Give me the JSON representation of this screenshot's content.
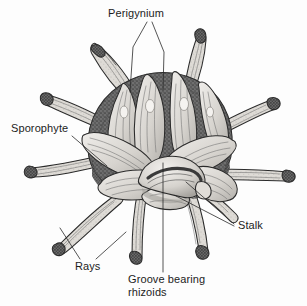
{
  "figure": {
    "kind": "botanical-illustration",
    "style": "grayscale stipple and line engraving",
    "background_color": "#fdfdfd",
    "ink_color": "#2b2b2b",
    "label_color": "#1c1c1c",
    "palette": {
      "paper": "#fdfdfd",
      "petal_light": "#e6e4e0",
      "petal_mid": "#c9c6c1",
      "petal_shadow": "#a9a6a1",
      "dome_dark": "#6b6b6b",
      "dome_darker": "#565656",
      "ray_light": "#dedbd6",
      "ray_tip_dark": "#5d5d5d",
      "outline": "#2b2b2b"
    }
  },
  "labels": {
    "perigynium": {
      "text": "Perigynium",
      "x": 108,
      "y": 17,
      "anchor": "start"
    },
    "sporophyte": {
      "text": "Sporophyte",
      "x": 11,
      "y": 132,
      "anchor": "start"
    },
    "stalk": {
      "text": "Stalk",
      "x": 238,
      "y": 229,
      "anchor": "start"
    },
    "rays": {
      "text": "Rays",
      "x": 75,
      "y": 270,
      "anchor": "start"
    },
    "groove_line1": {
      "text": "Groove bearing",
      "x": 128,
      "y": 283,
      "anchor": "start"
    },
    "groove_line2": {
      "text": "rhizoids",
      "x": 128,
      "y": 296,
      "anchor": "start"
    }
  },
  "leader_lines": {
    "perigynium_left": "M147,22 L133,47 L130,92",
    "perigynium_right": "M152,22 L164,52 L163,90",
    "sporophyte": "M72,136 L107,166",
    "stalk_upper": "M234,224 L186,182",
    "stalk_lower": "M234,226 L176,196",
    "rays_left": "M80,259 L60,228",
    "rays_right": "M96,259 L126,232",
    "groove": "M163,272 L163,163"
  },
  "parts": {
    "rays_count": 8,
    "perigynia_count": 9,
    "dome": "dark stippled receptacle behind the perigynia rosette",
    "stalk": "curved horn-shaped body at centre with dark longitudinal groove"
  }
}
